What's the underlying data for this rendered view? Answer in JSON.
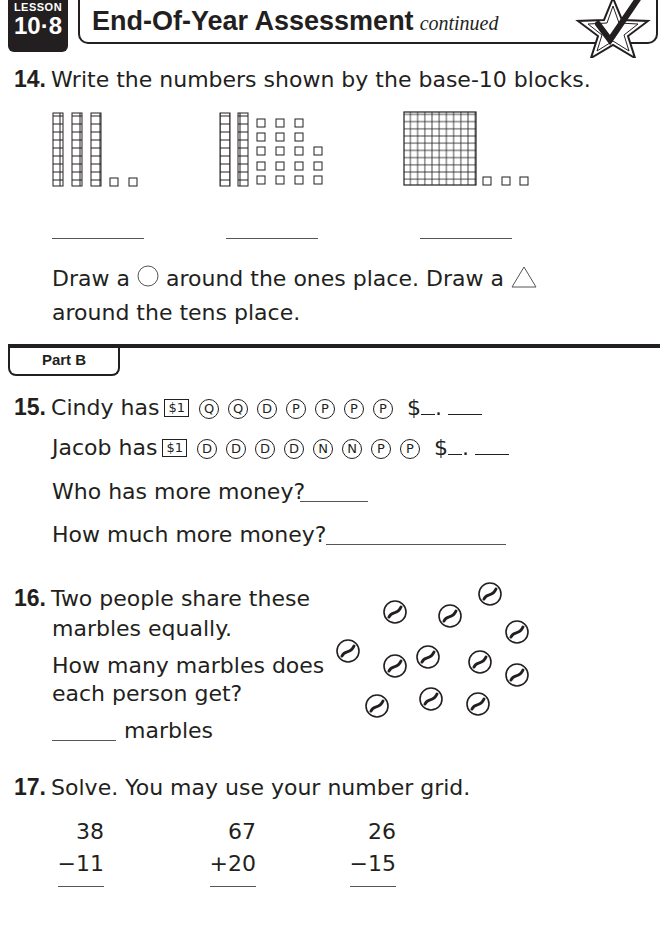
{
  "header": {
    "lesson_label": "LESSON",
    "lesson_number": "10·8",
    "title": "End-Of-Year Assessment",
    "title_suffix": "continued",
    "badge_icon": "star-checkmark-icon"
  },
  "q14": {
    "number": "14.",
    "prompt": "Write the numbers shown by the base-10 blocks.",
    "block_sets": [
      {
        "hundreds": 0,
        "tens": 3,
        "ones": 2
      },
      {
        "hundreds": 0,
        "tens": 2,
        "ones": 18
      },
      {
        "hundreds": 1,
        "tens": 0,
        "ones": 3
      }
    ],
    "instruction_part1": "Draw a",
    "instruction_part2": "around the ones place. Draw a",
    "instruction_part3": "around the tens place."
  },
  "part_b": {
    "label": "Part B"
  },
  "q15": {
    "number": "15.",
    "rows": [
      {
        "name_text": "Cindy has",
        "bill": "$1",
        "coins": [
          "Q",
          "Q",
          "D",
          "P",
          "P",
          "P",
          "P"
        ],
        "answer_prefix": "$",
        "separator": "."
      },
      {
        "name_text": "Jacob has",
        "bill": "$1",
        "coins": [
          "D",
          "D",
          "D",
          "D",
          "N",
          "N",
          "P",
          "P"
        ],
        "answer_prefix": "$",
        "separator": "."
      }
    ],
    "question1": "Who has more money?",
    "question2": "How much more money?"
  },
  "q16": {
    "number": "16.",
    "line1": "Two people share these",
    "line2": "marbles equally.",
    "line3": "How many marbles does",
    "line4": "each person get?",
    "answer_unit": "marbles",
    "marble_count": 12
  },
  "q17": {
    "number": "17.",
    "prompt": "Solve. You may use your number grid.",
    "problems": [
      {
        "top": "38",
        "bottom": "−11"
      },
      {
        "top": "67",
        "bottom": "+20"
      },
      {
        "top": "26",
        "bottom": "−15"
      }
    ]
  }
}
